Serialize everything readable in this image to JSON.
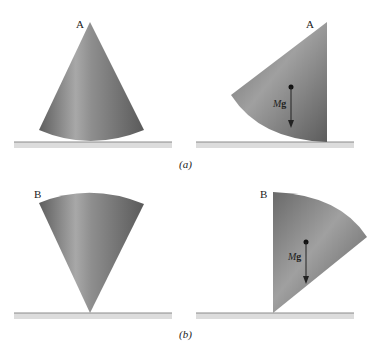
{
  "figure": {
    "panels": [
      {
        "id": "a",
        "caption": "(a)",
        "left": {
          "vertex_label": "A",
          "state": "cone standing on base"
        },
        "right": {
          "vertex_label": "A",
          "state": "cone tipped on side",
          "force_label_M": "M",
          "force_label_g": "g"
        }
      },
      {
        "id": "b",
        "caption": "(b)",
        "left": {
          "vertex_label": "B",
          "state": "cone balanced on apex"
        },
        "right": {
          "vertex_label": "B",
          "state": "cone tipped from apex",
          "force_label_M": "M",
          "force_label_g": "g"
        }
      }
    ],
    "colors": {
      "cone_dark": "#6f6f6f",
      "cone_light": "#b9b9b9",
      "ground": "#d9d9d9",
      "ground_edge": "#8a8a8a"
    }
  }
}
